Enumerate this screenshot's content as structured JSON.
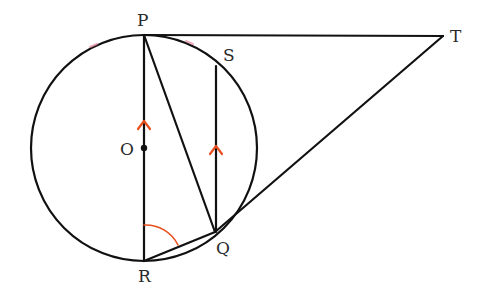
{
  "diagram": {
    "type": "circle-geometry",
    "colors": {
      "line": "#111111",
      "accent": "#e8501e",
      "label": "#2a2a2a",
      "artifact": "#e48aa0"
    },
    "circle": {
      "center": "O",
      "cx": 144,
      "cy": 148,
      "r": 113
    },
    "points": {
      "P": {
        "x": 144,
        "y": 35
      },
      "O": {
        "x": 144,
        "y": 148
      },
      "R": {
        "x": 144,
        "y": 261
      },
      "S": {
        "x": 216,
        "y": 66
      },
      "Q": {
        "x": 215,
        "y": 232
      },
      "T": {
        "x": 443,
        "y": 36
      }
    },
    "labels": {
      "P": "P",
      "O": "O",
      "R": "R",
      "S": "S",
      "Q": "Q",
      "T": "T"
    },
    "segments": [
      {
        "name": "PT",
        "from": "P",
        "to": "T",
        "note": "tangent at P"
      },
      {
        "name": "TQ",
        "from": "T",
        "to": "Q",
        "note": "tangent at Q"
      },
      {
        "name": "PR",
        "from": "P",
        "to": "R",
        "note": "diameter through O"
      },
      {
        "name": "PQ",
        "from": "P",
        "to": "Q"
      },
      {
        "name": "SQ",
        "from": "S",
        "to": "Q",
        "note": "parallel to PR"
      },
      {
        "name": "RQ",
        "from": "R",
        "to": "Q"
      }
    ],
    "marks": {
      "parallel_arrows": [
        "PR",
        "SQ"
      ],
      "angle": {
        "at": "R",
        "between": [
          "RP",
          "RQ"
        ],
        "name": "PRQ"
      }
    }
  }
}
